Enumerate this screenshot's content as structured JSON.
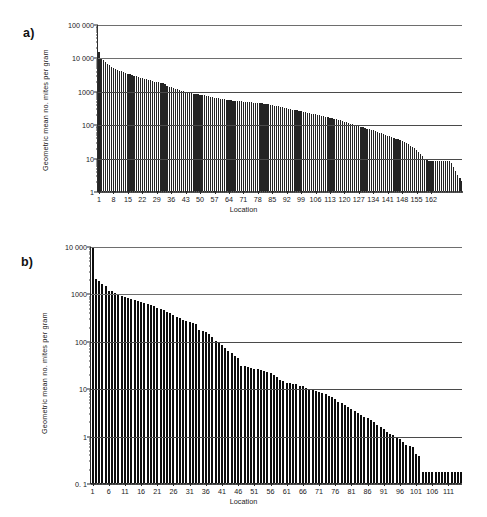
{
  "figure": {
    "panels": [
      {
        "id": "a",
        "label": "a)",
        "xlabel": "Location",
        "ylabel": "Geometric mean no. mites per gram"
      },
      {
        "id": "b",
        "label": "b)",
        "xlabel": "Location",
        "ylabel": "Geometric mean no. mites per gram"
      }
    ]
  },
  "chart_data": [
    {
      "type": "bar",
      "panel": "a)",
      "title": "",
      "xlabel": "Location",
      "ylabel": "Geometric mean no. mites per gram",
      "yscale": "log",
      "ylim": [
        1,
        100000
      ],
      "yticks": [
        1,
        10,
        100,
        1000,
        10000,
        100000
      ],
      "ytick_labels": [
        "1",
        "10",
        "100",
        "1000",
        "10 000",
        "100 000"
      ],
      "xlim": [
        1,
        167
      ],
      "xticks": [
        1,
        8,
        15,
        22,
        29,
        36,
        43,
        50,
        57,
        64,
        71,
        78,
        85,
        92,
        99,
        106,
        113,
        120,
        127,
        134,
        141,
        148,
        155,
        162
      ],
      "xtick_labels": [
        "1",
        "8",
        "15",
        "22",
        "29",
        "36",
        "43",
        "50",
        "57",
        "64",
        "71",
        "78",
        "85",
        "92",
        "99",
        "106",
        "113",
        "120",
        "127",
        "134",
        "141",
        "148",
        "155",
        "162"
      ],
      "grid": true,
      "n_bars": 167,
      "values": [
        15000,
        9800,
        8300,
        7200,
        6400,
        5800,
        5200,
        4800,
        4500,
        4200,
        4000,
        3800,
        3600,
        3400,
        3250,
        3100,
        2950,
        2800,
        2700,
        2600,
        2500,
        2400,
        2300,
        2200,
        2120,
        2050,
        1980,
        1900,
        1840,
        1780,
        1720,
        1660,
        1600,
        1400,
        1320,
        1260,
        1200,
        1150,
        1100,
        1050,
        1000,
        960,
        930,
        900,
        870,
        850,
        830,
        810,
        790,
        770,
        750,
        730,
        710,
        690,
        670,
        650,
        630,
        610,
        595,
        580,
        565,
        550,
        540,
        530,
        520,
        510,
        500,
        495,
        488,
        482,
        476,
        470,
        464,
        458,
        452,
        446,
        440,
        434,
        428,
        420,
        410,
        400,
        390,
        380,
        370,
        360,
        350,
        340,
        330,
        320,
        310,
        300,
        290,
        282,
        274,
        266,
        258,
        250,
        242,
        235,
        228,
        221,
        214,
        208,
        202,
        196,
        190,
        184,
        178,
        172,
        166,
        160,
        155,
        150,
        145,
        140,
        135,
        130,
        125,
        120,
        115,
        110,
        105,
        100,
        96,
        92,
        88,
        84,
        80,
        77,
        74,
        71,
        68,
        65,
        62,
        59,
        56,
        53,
        50,
        47,
        45,
        43,
        41,
        39,
        37,
        35,
        33,
        31,
        29,
        27,
        25,
        23,
        21,
        19,
        17,
        15,
        13,
        11,
        9.2,
        8.3,
        8.1,
        8.0,
        8.0,
        8.0,
        8.0,
        8.0,
        8.0,
        8.0,
        8.0,
        8.0,
        8.0,
        7.0,
        5.2,
        4.0,
        3.0,
        2.4,
        2.0
      ]
    },
    {
      "type": "bar",
      "panel": "b)",
      "title": "",
      "xlabel": "Location",
      "ylabel": "Geometric mean no. mites per gram",
      "yscale": "log",
      "ylim": [
        0.1,
        10000
      ],
      "yticks": [
        0.1,
        1,
        10,
        100,
        1000,
        10000
      ],
      "ytick_labels": [
        "0. 1",
        "1",
        "10",
        "100",
        "1000",
        "10 000"
      ],
      "xlim": [
        1,
        115
      ],
      "xticks": [
        1,
        6,
        11,
        16,
        21,
        26,
        31,
        36,
        41,
        46,
        51,
        56,
        61,
        66,
        71,
        76,
        81,
        86,
        91,
        96,
        101,
        106,
        111
      ],
      "xtick_labels": [
        "1",
        "6",
        "11",
        "16",
        "21",
        "26",
        "31",
        "36",
        "41",
        "46",
        "51",
        "56",
        "61",
        "66",
        "71",
        "76",
        "81",
        "86",
        "91",
        "96",
        "101",
        "106",
        "111"
      ],
      "grid": true,
      "n_bars": 115,
      "values": [
        9000,
        2000,
        1800,
        1600,
        1400,
        1150,
        1100,
        1000,
        930,
        880,
        840,
        800,
        760,
        720,
        690,
        660,
        630,
        600,
        570,
        540,
        500,
        470,
        440,
        410,
        380,
        350,
        320,
        300,
        280,
        265,
        250,
        240,
        230,
        170,
        160,
        150,
        140,
        120,
        100,
        92,
        82,
        72,
        62,
        55,
        48,
        44,
        30,
        29,
        28,
        27,
        26,
        25,
        24,
        23,
        22,
        21,
        19,
        17,
        15,
        14,
        13,
        13,
        12,
        12,
        11,
        11,
        10,
        9.6,
        9.2,
        8.6,
        8.2,
        7.8,
        7.4,
        7.0,
        6.4,
        5.8,
        5.2,
        4.8,
        4.4,
        4.0,
        3.6,
        3.3,
        3.0,
        2.7,
        2.5,
        2.3,
        2.1,
        1.9,
        1.7,
        1.5,
        1.35,
        1.2,
        1.1,
        1.05,
        0.95,
        0.85,
        0.75,
        0.62,
        0.6,
        0.58,
        0.4,
        0.38,
        0.17,
        0.17,
        0.17,
        0.17,
        0.17,
        0.17,
        0.17,
        0.17,
        0.17,
        0.17,
        0.17,
        0.17,
        0.17
      ]
    }
  ]
}
